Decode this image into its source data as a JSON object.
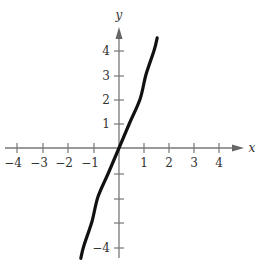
{
  "chart_data": {
    "type": "line",
    "title": "",
    "xlabel": "x",
    "ylabel": "y",
    "xlim": [
      -4.5,
      5
    ],
    "ylim": [
      -4.5,
      4.8
    ],
    "grid": false,
    "x_ticks": [
      -4,
      -3,
      -2,
      -1,
      1,
      2,
      3,
      4
    ],
    "y_ticks": [
      -4,
      -3,
      -2,
      -1,
      1,
      2,
      3,
      4
    ],
    "x_tick_labels": [
      "−4",
      "−3",
      "−2",
      "−1",
      "1",
      "2",
      "3",
      "4"
    ],
    "y_tick_labels": [
      "",
      "",
      "",
      "−4",
      "1",
      "2",
      "3",
      "4"
    ],
    "series": [
      {
        "name": "curve",
        "x": [
          -1.54,
          -1.42,
          -1.09,
          -0.85,
          -0.42,
          0,
          0.42,
          0.85,
          1.09,
          1.42,
          1.54
        ],
        "y": [
          -4.5,
          -4,
          -3,
          -2,
          -1,
          0,
          1,
          2,
          3,
          4,
          4.5
        ]
      }
    ]
  },
  "labels": {
    "x_axis": "x",
    "y_axis": "y",
    "x_ticks": [
      "−4",
      "−3",
      "−2",
      "−1",
      "1",
      "2",
      "3",
      "4"
    ],
    "y_ticks_pos": [
      "1",
      "2",
      "3",
      "4"
    ],
    "y_tick_neg4": "−4"
  }
}
